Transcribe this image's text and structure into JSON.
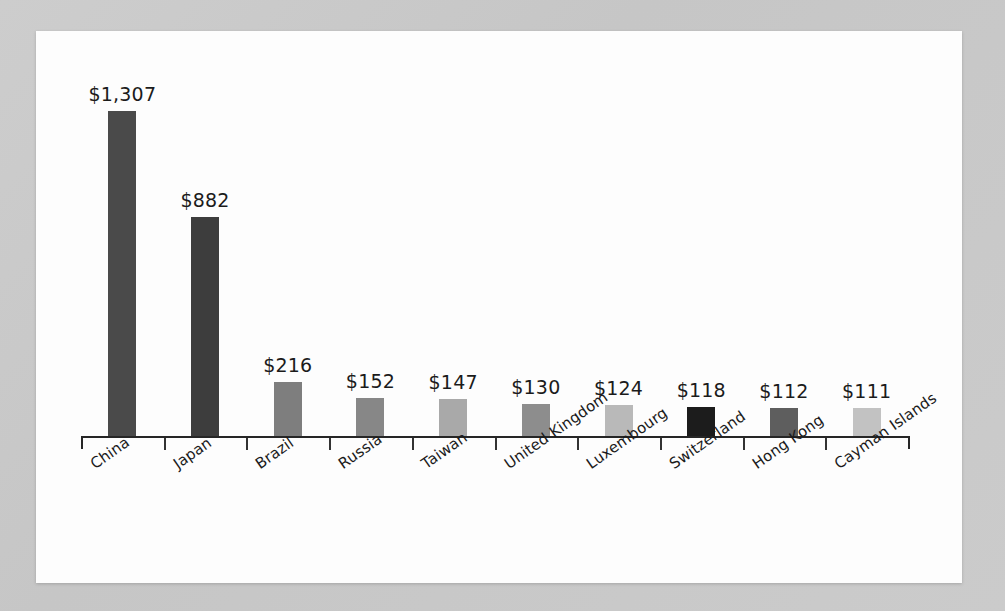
{
  "chart_data": {
    "type": "bar",
    "title": "",
    "subtitle": "",
    "xlabel": "",
    "ylabel": "",
    "value_prefix": "$",
    "ylim": [
      0,
      1400
    ],
    "grid": false,
    "legend": null,
    "categories": [
      "China",
      "Japan",
      "Brazil",
      "Russia",
      "Taiwan",
      "United Kingdom",
      "Luxembourg",
      "Switzerland",
      "Hong Kong",
      "Cayman Islands"
    ],
    "values": [
      1307,
      882,
      216,
      152,
      147,
      130,
      124,
      118,
      112,
      111
    ],
    "value_labels": [
      "$1,307",
      "$882",
      "$216",
      "$152",
      "$147",
      "$130",
      "$124",
      "$118",
      "$112",
      "$111"
    ],
    "bar_colors": [
      "#4a4a4a",
      "#3d3d3d",
      "#7e7e7e",
      "#878787",
      "#a9a9a9",
      "#8d8d8d",
      "#b9b9b9",
      "#1c1c1c",
      "#5e5e5e",
      "#c2c2c2"
    ]
  },
  "colors": {
    "page_background": "#c9c9c9",
    "card_background": "#fdfdfd",
    "axis": "#262626",
    "text": "#1b1b1b"
  }
}
